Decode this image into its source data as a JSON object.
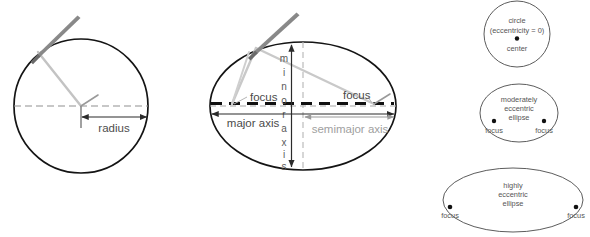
{
  "figure": {
    "background": "#ffffff",
    "stroke_dark": "#1a1a1a",
    "stroke_gray": "#808080",
    "stroke_light": "#b8b8b8",
    "text_dark": "#4d4d4d",
    "text_gray": "#9a9a9a",
    "width": 590,
    "height": 237
  },
  "panels": {
    "circle_panel": {
      "name": "circle-construction",
      "labels": {
        "radius": "radius"
      },
      "geometry": {
        "center_x": 81,
        "center_y": 106,
        "radius": 67
      }
    },
    "ellipse_panel": {
      "name": "ellipse-construction",
      "labels": {
        "minor_axis": "minor axis",
        "minor_axis_letters": [
          "m",
          "i",
          "n",
          "o",
          "r",
          "a",
          "x",
          "i",
          "s"
        ],
        "major_axis": "major axis",
        "semimajor_axis": "semimajor axis",
        "focus_left": "focus",
        "focus_right": "focus"
      },
      "geometry": {
        "center_x": 303,
        "center_y": 106,
        "semimajor": 93,
        "semiminor": 64,
        "focus_left_x": 232,
        "focus_right_x": 374
      }
    },
    "eccentricity_panel": {
      "name": "eccentricity-examples",
      "shapes": [
        {
          "id": "circle-eccentricity-zero",
          "lines": [
            "circle",
            "(eccentricity = 0)"
          ],
          "point_label": "center",
          "points": 1
        },
        {
          "id": "moderately-eccentric-ellipse",
          "lines": [
            "moderately",
            "eccentric",
            "ellipse"
          ],
          "point_label_left": "focus",
          "point_label_right": "focus",
          "points": 2
        },
        {
          "id": "highly-eccentric-ellipse",
          "lines": [
            "highly",
            "eccentric",
            "ellipse"
          ],
          "point_label_left": "focus",
          "point_label_right": "focus",
          "points": 2
        }
      ]
    }
  }
}
